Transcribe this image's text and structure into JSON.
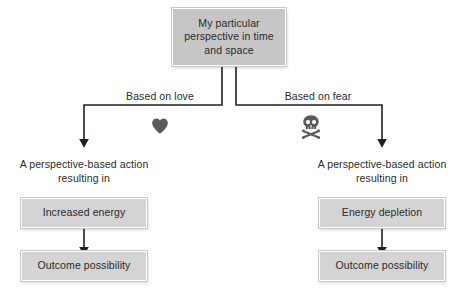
{
  "diagram": {
    "title_node": {
      "id": "root",
      "text": "My particular perspective in time and space"
    },
    "branches": [
      {
        "id": "love",
        "label": "Based on love",
        "icon": "heart-icon",
        "intro_text": "A perspective-based action resulting in",
        "nodes": [
          {
            "id": "increased-energy",
            "text": "Increased energy"
          },
          {
            "id": "outcome-possibility-left",
            "text": "Outcome possibility"
          }
        ]
      },
      {
        "id": "fear",
        "label": "Based on fear",
        "icon": "skull-and-crossbones-icon",
        "intro_text": "A perspective-based action resulting in",
        "nodes": [
          {
            "id": "energy-depletion",
            "text": "Energy depletion"
          },
          {
            "id": "outcome-possibility-right",
            "text": "Outcome possibility"
          }
        ]
      }
    ],
    "colors": {
      "background": "#ffffff",
      "root_fill": "#c6c6c6",
      "node_fill": "#d4d4d4",
      "node_border": "#ffffff",
      "node_outline": "#c9c9c9",
      "text": "#2b2b2b",
      "connector": "#231f20",
      "icon": "#5a5a5a"
    }
  }
}
